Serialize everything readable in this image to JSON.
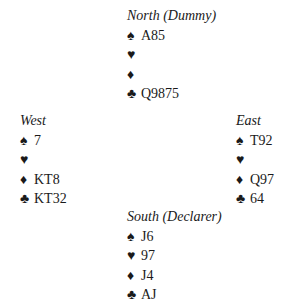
{
  "hands": {
    "north": {
      "label": "North (Dummy)",
      "spades": "A85",
      "hearts": "",
      "diamonds": "",
      "clubs": "Q9875"
    },
    "west": {
      "label": "West",
      "spades": "7",
      "hearts": "",
      "diamonds": "KT8",
      "clubs": "KT32"
    },
    "east": {
      "label": "East",
      "spades": "T92",
      "hearts": "",
      "diamonds": "Q97",
      "clubs": "64"
    },
    "south": {
      "label": "South (Declarer)",
      "spades": "J6",
      "hearts": "97",
      "diamonds": "J4",
      "clubs": "AJ"
    }
  },
  "suit_icons": {
    "spades": "♠",
    "hearts": "♥",
    "diamonds": "♦",
    "clubs": "♣"
  }
}
